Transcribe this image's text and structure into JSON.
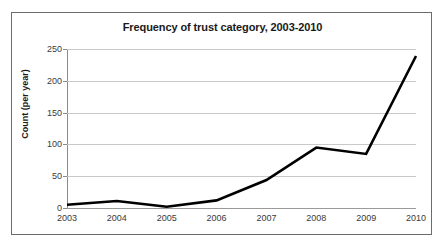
{
  "chart_data": {
    "type": "line",
    "title": "Frequency of trust category, 2003-2010",
    "xlabel": "",
    "ylabel": "Count (per year)",
    "categories": [
      "2003",
      "2004",
      "2005",
      "2006",
      "2007",
      "2008",
      "2009",
      "2010"
    ],
    "x": [
      2003,
      2004,
      2005,
      2006,
      2007,
      2008,
      2009,
      2010
    ],
    "values": [
      5,
      11,
      2,
      12,
      44,
      95,
      85,
      239
    ],
    "series": [
      {
        "name": "Count (per year)",
        "values": [
          5,
          11,
          2,
          12,
          44,
          95,
          85,
          239
        ],
        "color": "#000000",
        "line_width": 2.6,
        "markers": false
      }
    ],
    "ylim": [
      0,
      250
    ],
    "yticks": [
      0,
      50,
      100,
      150,
      200,
      250
    ],
    "ytick_labels": [
      "0",
      "50",
      "100",
      "150",
      "200",
      "250"
    ],
    "grid": "horizontal",
    "grid_color": "#c9c9c9",
    "legend": false,
    "legend_position": "none",
    "plot_background": "#ffffff",
    "figure_border_color": "#6b6b6b",
    "axis_color": "#8a8a8a"
  }
}
